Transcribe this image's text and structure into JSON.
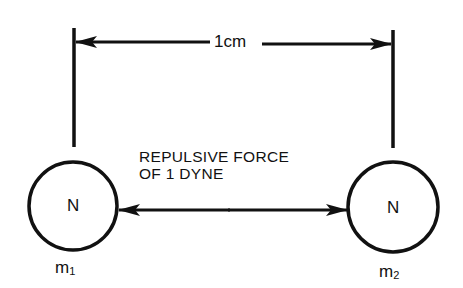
{
  "diagram": {
    "distance_label": "1cm",
    "force_label_line1": "REPULSIVE FORCE",
    "force_label_line2": "OF 1 DYNE",
    "poles": [
      {
        "symbol": "N",
        "mass_base": "m",
        "mass_subscript": "1"
      },
      {
        "symbol": "N",
        "mass_base": "m",
        "mass_subscript": "2"
      }
    ],
    "colors": {
      "stroke": "#111111",
      "background": "#ffffff"
    }
  }
}
